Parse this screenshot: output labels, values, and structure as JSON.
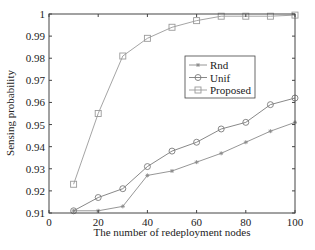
{
  "chart_data": {
    "type": "line",
    "title": "",
    "xlabel": "The number of redeployment nodes",
    "ylabel": "Sensing probability",
    "x": [
      10,
      20,
      30,
      40,
      50,
      60,
      70,
      80,
      90,
      100
    ],
    "xlim": [
      0,
      100
    ],
    "ylim": [
      0.91,
      1.0
    ],
    "xticks": [
      0,
      20,
      40,
      60,
      80,
      100
    ],
    "xtick_labels": [
      "0",
      "20",
      "40",
      "60",
      "80",
      "100"
    ],
    "yticks": [
      0.91,
      0.92,
      0.93,
      0.94,
      0.95,
      0.96,
      0.97,
      0.98,
      0.99,
      1.0
    ],
    "ytick_labels": [
      "0.91",
      "0.92",
      "0.93",
      "0.94",
      "0.95",
      "0.96",
      "0.97",
      "0.98",
      "0.99",
      "1"
    ],
    "grid": false,
    "legend_position": "upper right (inside)",
    "series": [
      {
        "name": "Rnd",
        "marker": "asterisk",
        "color": "#8a8a8a",
        "values": [
          0.911,
          0.911,
          0.913,
          0.927,
          0.929,
          0.933,
          0.937,
          0.942,
          0.947,
          0.951
        ]
      },
      {
        "name": "Unif",
        "marker": "circle",
        "color": "#7a7a7a",
        "values": [
          0.911,
          0.917,
          0.921,
          0.931,
          0.938,
          0.942,
          0.948,
          0.951,
          0.959,
          0.962
        ]
      },
      {
        "name": "Proposed",
        "marker": "square",
        "color": "#9a9a9a",
        "values": [
          0.923,
          0.955,
          0.981,
          0.989,
          0.994,
          0.997,
          0.999,
          0.999,
          0.999,
          0.9995
        ]
      }
    ]
  }
}
